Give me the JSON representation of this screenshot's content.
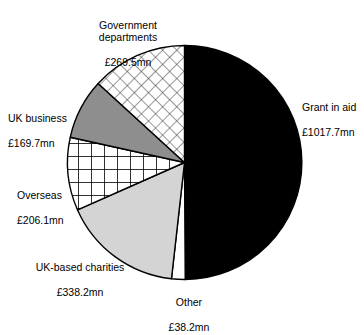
{
  "chart_data": {
    "type": "pie",
    "title": "",
    "currency_unit": "£mn",
    "total": 2039.4,
    "categories": [
      "Grant in aid",
      "Other",
      "UK-based charities",
      "Overseas",
      "UK business",
      "Government departments"
    ],
    "values": [
      1017.7,
      38.2,
      338.2,
      206.1,
      169.7,
      269.5
    ],
    "value_labels": [
      "£1017.7mn",
      "£38.2mn",
      "£338.2mn",
      "£206.1mn",
      "£169.7mn",
      "£269.5mn"
    ],
    "slices": [
      {
        "label": "Grant in aid",
        "value": 1017.7,
        "value_label": "£1017.7mn",
        "fill": "solid-black",
        "color": "#000000",
        "start_angle_deg": 0,
        "sweep_deg": 179.7
      },
      {
        "label": "Other",
        "value": 38.2,
        "value_label": "£38.2mn",
        "fill": "white",
        "color": "#ffffff",
        "start_angle_deg": 179.7,
        "sweep_deg": 6.7
      },
      {
        "label": "UK-based charities",
        "value": 338.2,
        "value_label": "£338.2mn",
        "fill": "light-grey",
        "color": "#d2d2d2",
        "start_angle_deg": 186.4,
        "sweep_deg": 59.7
      },
      {
        "label": "Overseas",
        "value": 206.1,
        "value_label": "£206.1mn",
        "fill": "square-grid-hatch",
        "color": "#ffffff",
        "start_angle_deg": 246.1,
        "sweep_deg": 36.4
      },
      {
        "label": "UK business",
        "value": 169.7,
        "value_label": "£169.7mn",
        "fill": "mid-grey",
        "color": "#909090",
        "start_angle_deg": 282.5,
        "sweep_deg": 30.0
      },
      {
        "label": "Government departments",
        "value": 269.5,
        "value_label": "£269.5mn",
        "fill": "diagonal-crosshatch",
        "color": "#ffffff",
        "start_angle_deg": 312.5,
        "sweep_deg": 47.6
      }
    ],
    "legend": "inline-callout-labels",
    "grid": false,
    "xlabel": "",
    "ylabel": ""
  },
  "labels": {
    "government_departments": {
      "name": "Government\ndepartments",
      "value": "£269.5mn"
    },
    "grant_in_aid": {
      "name": "Grant in aid",
      "value": "£1017.7mn"
    },
    "uk_business": {
      "name": "UK business",
      "value": "£169.7mn"
    },
    "overseas": {
      "name": "Overseas",
      "value": "£206.1mn"
    },
    "uk_based_charities": {
      "name": "UK-based charities",
      "value": "£338.2mn"
    },
    "other": {
      "name": "Other",
      "value": "£38.2mn"
    }
  }
}
